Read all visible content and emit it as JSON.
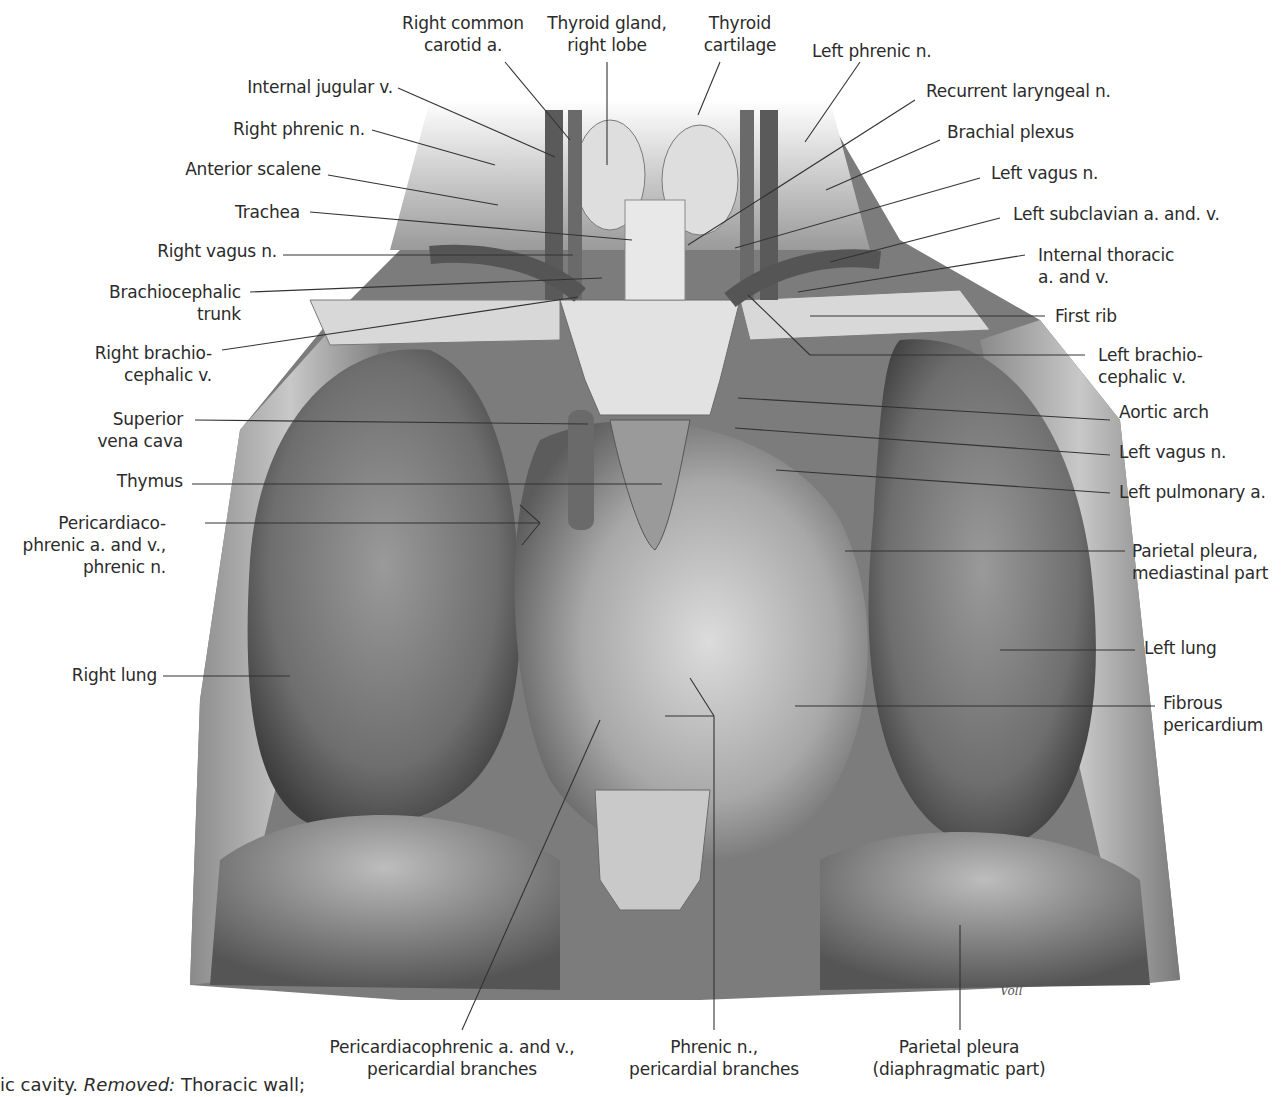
{
  "figure": {
    "caption_visible": {
      "prefix": "ic cavity.",
      "removed_label": "Removed:",
      "removed_text": "Thoracic wall;"
    },
    "signature": "Voll",
    "colors": {
      "background": "#ffffff",
      "illustration_dark": "#4a4a4a",
      "illustration_mid": "#8c8c8c",
      "illustration_light": "#d6d6d6",
      "leader_line": "#333333",
      "text": "#2b2b2b"
    }
  },
  "labels": {
    "top": [
      {
        "id": "right-common-carotid",
        "lines": [
          "Right common",
          "carotid a."
        ]
      },
      {
        "id": "thyroid-gland-right-lobe",
        "lines": [
          "Thyroid gland,",
          "right lobe"
        ]
      },
      {
        "id": "thyroid-cartilage",
        "lines": [
          "Thyroid",
          "cartilage"
        ]
      },
      {
        "id": "left-phrenic-n",
        "lines": [
          "Left phrenic n."
        ]
      }
    ],
    "left": [
      {
        "id": "internal-jugular-v",
        "lines": [
          "Internal jugular v."
        ]
      },
      {
        "id": "right-phrenic-n",
        "lines": [
          "Right phrenic n."
        ]
      },
      {
        "id": "anterior-scalene",
        "lines": [
          "Anterior scalene"
        ]
      },
      {
        "id": "trachea",
        "lines": [
          "Trachea"
        ]
      },
      {
        "id": "right-vagus-n",
        "lines": [
          "Right vagus n."
        ]
      },
      {
        "id": "brachiocephalic-trunk",
        "lines": [
          "Brachiocephalic",
          "trunk"
        ]
      },
      {
        "id": "right-brachiocephalic-v",
        "lines": [
          "Right brachio-",
          "cephalic v."
        ]
      },
      {
        "id": "superior-vena-cava",
        "lines": [
          "Superior",
          "vena cava"
        ]
      },
      {
        "id": "thymus",
        "lines": [
          "Thymus"
        ]
      },
      {
        "id": "pericardiacophrenic",
        "lines": [
          "Pericardiaco-",
          "phrenic a. and v.,",
          "phrenic n."
        ]
      },
      {
        "id": "right-lung",
        "lines": [
          "Right lung"
        ]
      }
    ],
    "right": [
      {
        "id": "recurrent-laryngeal-n",
        "lines": [
          "Recurrent laryngeal n."
        ]
      },
      {
        "id": "brachial-plexus",
        "lines": [
          "Brachial plexus"
        ]
      },
      {
        "id": "left-vagus-n-upper",
        "lines": [
          "Left vagus n."
        ]
      },
      {
        "id": "left-subclavian",
        "lines": [
          "Left subclavian a. and. v."
        ]
      },
      {
        "id": "internal-thoracic",
        "lines": [
          "Internal thoracic",
          "a. and v."
        ]
      },
      {
        "id": "first-rib",
        "lines": [
          "First rib"
        ]
      },
      {
        "id": "left-brachiocephalic-v",
        "lines": [
          "Left brachio-",
          "cephalic v."
        ]
      },
      {
        "id": "aortic-arch",
        "lines": [
          "Aortic arch"
        ]
      },
      {
        "id": "left-vagus-n-lower",
        "lines": [
          "Left vagus n."
        ]
      },
      {
        "id": "left-pulmonary-a",
        "lines": [
          "Left pulmonary a."
        ]
      },
      {
        "id": "parietal-pleura-mediastinal",
        "lines": [
          "Parietal pleura,",
          "mediastinal part"
        ]
      },
      {
        "id": "left-lung",
        "lines": [
          "Left lung"
        ]
      },
      {
        "id": "fibrous-pericardium",
        "lines": [
          "Fibrous",
          "pericardium"
        ]
      }
    ],
    "bottom": [
      {
        "id": "pericardiacophrenic-branches",
        "lines": [
          "Pericardiacophrenic a. and v.,",
          "pericardial branches"
        ]
      },
      {
        "id": "phrenic-n-branches",
        "lines": [
          "Phrenic n.,",
          "pericardial branches"
        ]
      },
      {
        "id": "parietal-pleura-diaphragmatic",
        "lines": [
          "Parietal pleura",
          "(diaphragmatic part)"
        ]
      }
    ]
  }
}
